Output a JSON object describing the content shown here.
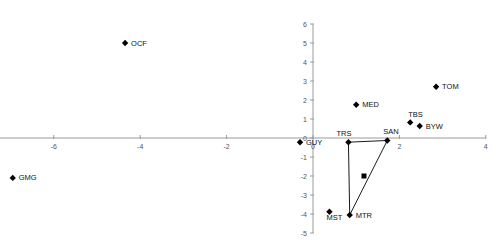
{
  "chart_data": {
    "type": "scatter",
    "title": "",
    "subtitle": "",
    "xlabel": "",
    "ylabel": "",
    "xlim": [
      -8,
      4
    ],
    "ylim": [
      -5,
      6
    ],
    "xticks": [
      -8,
      -6,
      -4,
      -2,
      0,
      2,
      4
    ],
    "xtick_labels": [
      "-8",
      "-6",
      "-4",
      "-2",
      "0",
      "2",
      "4"
    ],
    "yticks": [
      -5,
      -4,
      -3,
      -2,
      -1,
      0,
      1,
      2,
      3,
      4,
      5,
      6
    ],
    "ytick_labels": [
      "-5",
      "-4",
      "-3",
      "-2",
      "-1",
      "0",
      "1",
      "2",
      "3",
      "4",
      "5",
      "6"
    ],
    "grid": false,
    "legend": "none",
    "axis_color": "#9a9a9a",
    "marker_color": "#000000",
    "points": [
      {
        "label": "OCF",
        "x": -4.35,
        "y": 5.0,
        "marker": "diamond",
        "label_dx": 6,
        "label_dy": 2.5
      },
      {
        "label": "GMG",
        "x": -6.95,
        "y": -2.1,
        "marker": "diamond",
        "label_dx": 6,
        "label_dy": 2.5
      },
      {
        "label": "GUY",
        "x": -0.3,
        "y": -0.22,
        "marker": "diamond",
        "label_dx": 6,
        "label_dy": 2.5
      },
      {
        "label": "MED",
        "x": 1.0,
        "y": 1.75,
        "marker": "diamond",
        "label_dx": 6,
        "label_dy": 2.5
      },
      {
        "label": "TOM",
        "x": 2.85,
        "y": 2.7,
        "marker": "diamond",
        "label_dx": 6,
        "label_dy": 2.5
      },
      {
        "label": "TBS",
        "x": 2.25,
        "y": 0.82,
        "marker": "diamond",
        "label_dx": -2,
        "label_dy": -5
      },
      {
        "label": "BYW",
        "x": 2.47,
        "y": 0.63,
        "marker": "diamond",
        "label_dx": 6,
        "label_dy": 3
      },
      {
        "label": "TRS",
        "x": 0.82,
        "y": -0.22,
        "marker": "diamond",
        "label_dx": -12,
        "label_dy": -6
      },
      {
        "label": "SAN",
        "x": 1.72,
        "y": -0.13,
        "marker": "diamond",
        "label_dx": -4,
        "label_dy": -6
      },
      {
        "label": "MTR",
        "x": 0.85,
        "y": -4.05,
        "marker": "diamond",
        "label_dx": 6,
        "label_dy": 3
      },
      {
        "label": "MST",
        "x": 0.38,
        "y": -3.88,
        "marker": "diamond",
        "label_dx": -3,
        "label_dy": 8
      }
    ],
    "centroid": {
      "label": "",
      "x": 1.18,
      "y": -2.0,
      "marker": "square"
    },
    "connections": [
      {
        "from": "TRS",
        "to": "SAN"
      },
      {
        "from": "TRS",
        "to": "MTR"
      },
      {
        "from": "SAN",
        "to": "MTR"
      }
    ]
  }
}
